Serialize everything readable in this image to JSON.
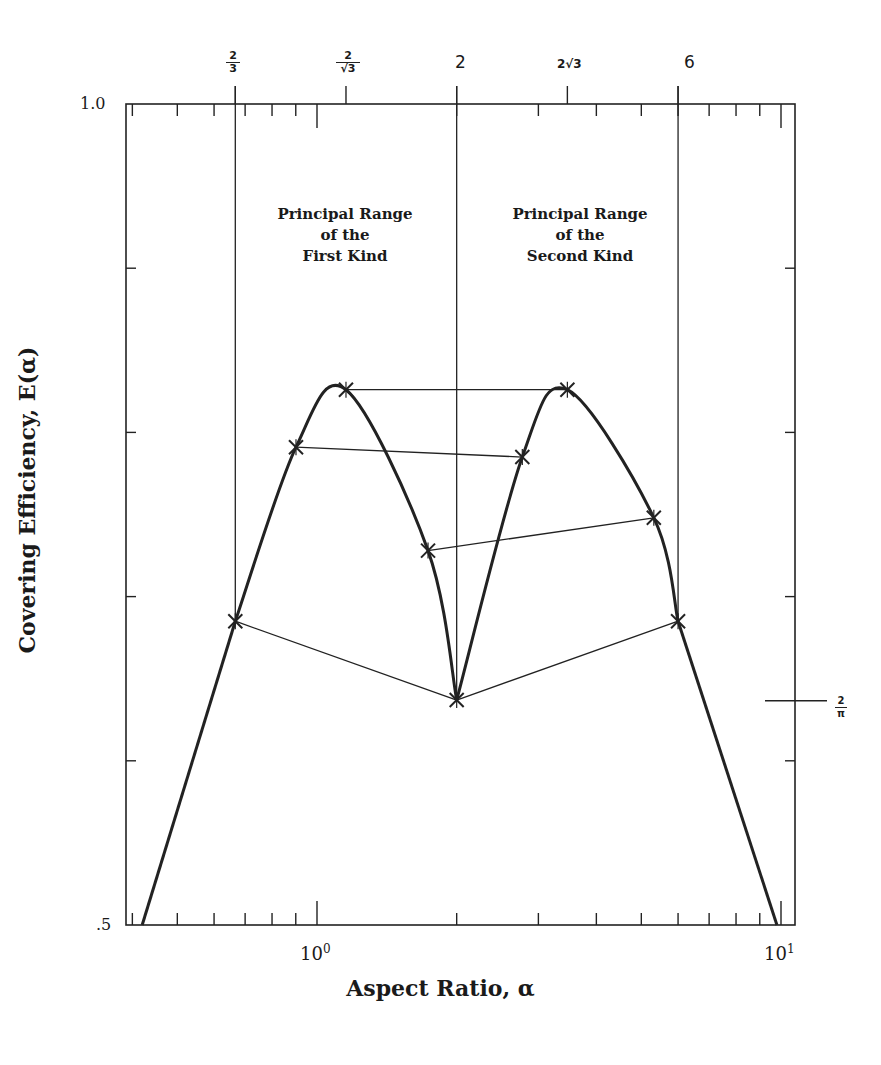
{
  "chart_data": {
    "type": "line",
    "title": "",
    "xlabel": "Aspect Ratio, α",
    "ylabel": "Covering Efficiency, E(α)",
    "x_scale": "log",
    "xlim": [
      0.39,
      10.3
    ],
    "ylim": [
      0.5,
      1.0
    ],
    "y_scale_note": "linear scale assumed between the two labeled ticks (.5 at bottom, 1.0 at top); interior values are pixel estimates",
    "x_tick_labels": [
      "10^0",
      "10^1"
    ],
    "y_tick_labels": [
      ".5",
      "1.0"
    ],
    "y_ticks_unlabeled_inferred": [
      0.6,
      0.7,
      0.8,
      0.9
    ],
    "top_axis_labels": [
      "2/3",
      "2/√3",
      "2",
      "2√3",
      "6"
    ],
    "top_axis_values": [
      0.6667,
      1.1547,
      2.0,
      3.4641,
      6.0
    ],
    "right_axis_annotation": {
      "label": "2/π",
      "value": 0.6366
    },
    "vertical_reference_lines": [
      0.6667,
      2.0,
      6.0
    ],
    "region_labels": [
      {
        "text": "Principal Range of the First Kind",
        "x_range": [
          0.6667,
          2.0
        ]
      },
      {
        "text": "Principal Range of the Second Kind",
        "x_range": [
          2.0,
          6.0
        ]
      }
    ],
    "grid": false,
    "legend": null,
    "series": [
      {
        "name": "E(α) curve",
        "style": "thick solid",
        "x": [
          0.42,
          0.6667,
          0.901,
          1.1547,
          1.735,
          2.0,
          2.77,
          3.4641,
          5.32,
          6.0,
          9.8
        ],
        "y": [
          0.5,
          0.685,
          0.791,
          0.826,
          0.728,
          0.637,
          0.785,
          0.826,
          0.748,
          0.685,
          0.5
        ]
      },
      {
        "name": "Correspondence lines (marked × points)",
        "style": "thin solid",
        "segments": [
          {
            "from": [
              0.6667,
              0.685
            ],
            "to": [
              2.0,
              0.637
            ]
          },
          {
            "from": [
              2.0,
              0.637
            ],
            "to": [
              6.0,
              0.685
            ]
          },
          {
            "from": [
              0.901,
              0.791
            ],
            "to": [
              2.77,
              0.785
            ]
          },
          {
            "from": [
              1.735,
              0.728
            ],
            "to": [
              5.32,
              0.748
            ]
          },
          {
            "from": [
              1.1547,
              0.826
            ],
            "to": [
              3.4641,
              0.826
            ]
          }
        ]
      }
    ],
    "markers": [
      {
        "x": 0.6667,
        "y": 0.685
      },
      {
        "x": 0.901,
        "y": 0.791
      },
      {
        "x": 1.1547,
        "y": 0.826
      },
      {
        "x": 1.735,
        "y": 0.728
      },
      {
        "x": 2.0,
        "y": 0.637
      },
      {
        "x": 2.77,
        "y": 0.785
      },
      {
        "x": 3.4641,
        "y": 0.826
      },
      {
        "x": 5.32,
        "y": 0.748
      },
      {
        "x": 6.0,
        "y": 0.685
      }
    ]
  },
  "labels": {
    "ylabel": "Covering Efficiency, E(α)",
    "xlabel": "Aspect Ratio, α",
    "y_top": "1.0",
    "y_bottom": ".5",
    "x_10_0_base": "10",
    "x_10_0_exp": "0",
    "x_10_1_base": "10",
    "x_10_1_exp": "1",
    "top_two": "2",
    "top_six": "6",
    "top_two_thirds_num": "2",
    "top_two_thirds_den": "3",
    "top_two_over_root3_num": "2",
    "top_two_over_root3_den": "√3",
    "top_two_root3": "2√3",
    "two_over_pi_num": "2",
    "two_over_pi_den": "π",
    "region1_line1": "Principal Range",
    "region1_line2": "of the",
    "region1_line3": "First Kind",
    "region2_line1": "Principal Range",
    "region2_line2": "of the",
    "region2_line3": "Second Kind"
  }
}
